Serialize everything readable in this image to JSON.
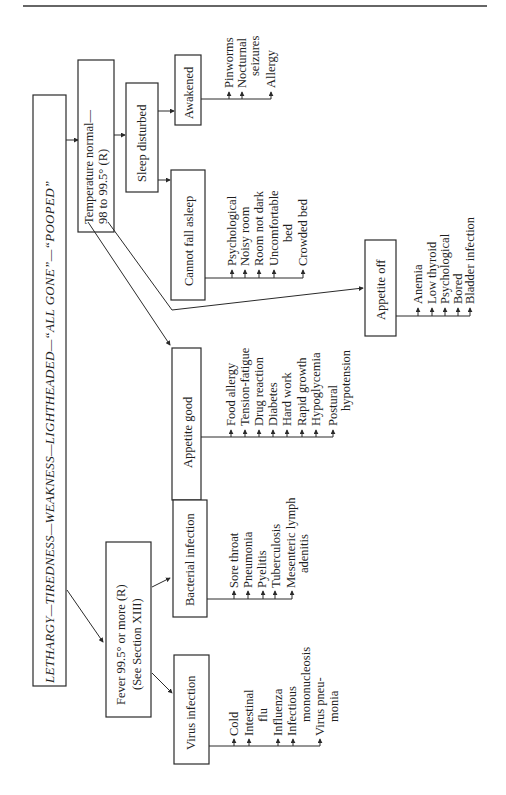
{
  "diagram": {
    "orientation": "rotated-90-ccw",
    "root": {
      "label": "LETHARGY—TIREDNESS—WEAKNESS—LIGHTHEADED—“ALL GONE”—“POOPED”"
    },
    "fever": {
      "line1": "Fever 99.5° or more (R)",
      "line2": "(See Section XIII)",
      "bacterial": {
        "label": "Bacterial infection",
        "items": [
          "Sore throat",
          "Pneumonia",
          "Pyelitis",
          "Tuberculosis",
          "Mesenteric lymph",
          "adenitis"
        ]
      },
      "virus": {
        "label": "Virus infection",
        "items": [
          "Cold",
          "Intestinal",
          "flu",
          "Influenza",
          "Infectious",
          "mononucleosis",
          "Virus pneu-",
          "monia"
        ]
      }
    },
    "temperature_normal": {
      "line1": "Temperature normal—",
      "line2": "98 to 99.5° (R)",
      "sleep_disturbed": {
        "label": "Sleep disturbed",
        "awakened": {
          "label": "Awakened",
          "items": [
            "Pinworms",
            "Nocturnal",
            "seizures",
            "Allergy"
          ]
        },
        "cannot_fall_asleep": {
          "label": "Cannot fall asleep",
          "items": [
            "Psychological",
            "Noisy room",
            "Room not dark",
            "Uncomfortable",
            "bed",
            "Crowded bed"
          ]
        }
      },
      "appetite_good": {
        "label": "Appetite good",
        "items": [
          "Food allergy",
          "Tension-fatigue",
          "Drug reaction",
          "Diabetes",
          "Hard work",
          "Rapid growth",
          "Hypoglycemia",
          "Postural",
          "hypotension"
        ]
      },
      "appetite_off": {
        "label": "Appetite off",
        "items": [
          "Anemia",
          "Low thyroid",
          "Psychological",
          "Bored",
          "Bladder infection"
        ]
      }
    }
  }
}
